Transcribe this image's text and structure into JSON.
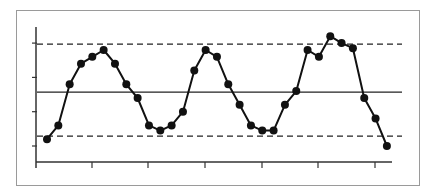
{
  "chart_data": {
    "type": "line",
    "title": "",
    "xlabel": "",
    "ylabel": "",
    "x": [
      1,
      2,
      3,
      4,
      5,
      6,
      7,
      8,
      9,
      10,
      11,
      12,
      13,
      14,
      15,
      16,
      17,
      18,
      19,
      20,
      21,
      22,
      23,
      24,
      25,
      26,
      27,
      28,
      29,
      30,
      31
    ],
    "series": [
      {
        "name": "measurements",
        "values": [
          1.2,
          1.6,
          2.8,
          3.4,
          3.6,
          3.8,
          3.4,
          2.8,
          2.4,
          1.6,
          1.45,
          1.6,
          2.0,
          3.2,
          3.8,
          3.6,
          2.8,
          2.2,
          1.6,
          1.45,
          1.45,
          2.2,
          2.6,
          3.8,
          3.6,
          4.2,
          4.0,
          3.85,
          2.4,
          1.8,
          1.0
        ]
      }
    ],
    "reference_lines": {
      "center_line": 2.57,
      "upper_control_limit": 3.97,
      "lower_control_limit": 1.29
    },
    "y_ticks": [
      1,
      2,
      3,
      4
    ],
    "x_tick_count": 6,
    "ylim": [
      0.53,
      4.27
    ],
    "xlim": [
      0,
      31
    ],
    "grid": false,
    "legend": null,
    "colors": {
      "line": "#111111",
      "marker": "#111111",
      "center_line": "#222222",
      "limit_lines": "#222222",
      "axes": "#333333",
      "frame": "#9a9a9a"
    }
  }
}
